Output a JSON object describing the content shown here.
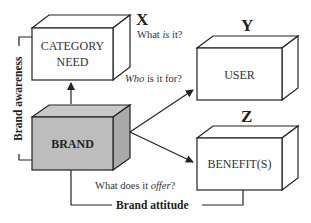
{
  "diagram": {
    "boxes": {
      "category_need": {
        "label_line1": "CATEGORY",
        "label_line2": "NEED",
        "fill": "#ffffff"
      },
      "user": {
        "label": "USER",
        "fill": "#ffffff"
      },
      "benefits": {
        "label": "BENEFIT(S)",
        "fill": "#ffffff"
      },
      "brand": {
        "label": "BRAND",
        "fill": "#bdbdbd"
      }
    },
    "letters": {
      "x": "X",
      "y": "Y",
      "z": "Z"
    },
    "questions": {
      "what_pre": "What ",
      "what_em": "is",
      "what_post": " it?",
      "who_em": "Who",
      "who_post": " is it for?",
      "offer_pre": "What does it ",
      "offer_em": "offer",
      "offer_post": "?"
    },
    "brackets": {
      "awareness": "Brand awareness",
      "attitude": "Brand attitude"
    }
  }
}
